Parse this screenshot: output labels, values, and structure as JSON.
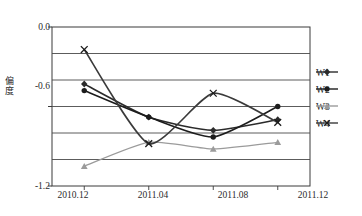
{
  "chart_data": {
    "type": "line",
    "title": "",
    "xlabel": "",
    "ylabel": "偏度",
    "categories": [
      "2010.12",
      "2011.04",
      "2011.08",
      "2011.12"
    ],
    "ylim": [
      -1.2,
      0.0
    ],
    "yticks": [
      0.0,
      -0.6,
      -1.2
    ],
    "ytick_labels": [
      "0.0",
      "-0.6",
      "-1.2"
    ],
    "gridlines": [
      -0.2,
      -0.4,
      -0.6,
      -0.8,
      -1.0
    ],
    "grid": true,
    "legend_position": "right",
    "series": [
      {
        "name": "W1",
        "marker": "diamond",
        "color": "#2b2b2b",
        "values": [
          -0.43,
          -0.68,
          -0.78,
          -0.7
        ]
      },
      {
        "name": "W2",
        "marker": "circle",
        "color": "#1c1c1c",
        "values": [
          -0.48,
          -0.68,
          -0.83,
          -0.6
        ]
      },
      {
        "name": "W3",
        "marker": "triangle",
        "color": "#9b9b9b",
        "values": [
          -1.05,
          -0.87,
          -0.92,
          -0.87
        ]
      },
      {
        "name": "W4",
        "marker": "cross",
        "color": "#3a3a3a",
        "values": [
          -0.17,
          -0.88,
          -0.5,
          -0.72
        ]
      }
    ]
  },
  "axis": {
    "y_label": "偏度",
    "y_tick_top": "0.0",
    "y_tick_mid": "-0.6",
    "y_tick_bottom": "-1.2",
    "x_tick_1": "2010.12",
    "x_tick_2": "2011.04",
    "x_tick_3": "2011.08",
    "x_tick_4": "2011.12"
  },
  "legend": {
    "items": [
      {
        "label": "W1"
      },
      {
        "label": "W2"
      },
      {
        "label": "W3"
      },
      {
        "label": "W4"
      }
    ]
  },
  "caption": {
    "text": ""
  }
}
